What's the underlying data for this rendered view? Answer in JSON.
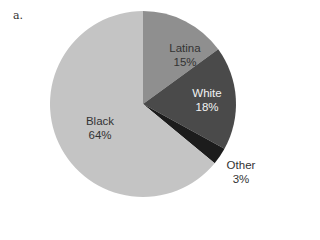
{
  "panel_label": "a.",
  "chart_data": {
    "type": "pie",
    "title": "",
    "categories": [
      "Latina",
      "White",
      "Other",
      "Black"
    ],
    "values": [
      15,
      18,
      3,
      64
    ],
    "unit": "%",
    "start_angle_deg": 0,
    "direction": "clockwise",
    "colors": [
      "#8f8f8f",
      "#4a4a4a",
      "#1c1c1c",
      "#c4c4c4"
    ],
    "labels": [
      {
        "name": "Latina",
        "value": "15%"
      },
      {
        "name": "White",
        "value": "18%"
      },
      {
        "name": "Other",
        "value": "3%"
      },
      {
        "name": "Black",
        "value": "64%"
      }
    ],
    "legend": "none (inline labels)"
  }
}
